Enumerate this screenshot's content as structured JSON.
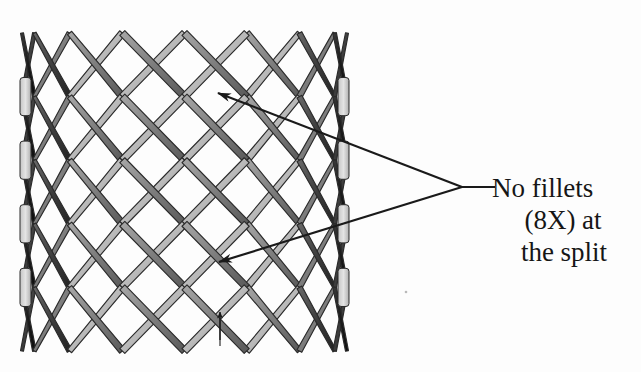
{
  "figure": {
    "background_color": "#fdfdfd",
    "type": "engineering-illustration-grayscale",
    "mesh": {
      "name": "cylindrical-diamond-lattice-stent",
      "bounds": {
        "x": 22,
        "y": 33,
        "width": 325,
        "height": 318
      },
      "columns": 8,
      "rows": 5,
      "cell_width": 46,
      "cell_height": 64,
      "strut_width": 7,
      "perspective": "cylindrical-foreshortening-at-edges",
      "colors": {
        "strut_light": "#c9c9c9",
        "strut_mid": "#8a8a8a",
        "strut_dark": "#4a4a4a",
        "strut_darkest": "#1e1e1e",
        "outline": "#2a2a2a",
        "edge_band_light": "#d8d8d8"
      }
    },
    "annotation": {
      "name": "no-fillets-callout",
      "line_color": "#1a1a1a",
      "line_width": 2.2,
      "elbow": {
        "x": 462,
        "y": 187
      },
      "tail_end": {
        "x": 495,
        "y": 187
      },
      "arrows": [
        {
          "tip_x": 218,
          "tip_y": 93
        },
        {
          "tip_x": 219,
          "tip_y": 262
        }
      ],
      "text_lines": [
        "No fillets",
        "(8X) at",
        "the split"
      ]
    },
    "dimension_marker": {
      "name": "split-gap-dimension-arrow",
      "x": 220,
      "y_top": 312,
      "y_bottom": 340,
      "color": "#1a1a1a"
    }
  }
}
